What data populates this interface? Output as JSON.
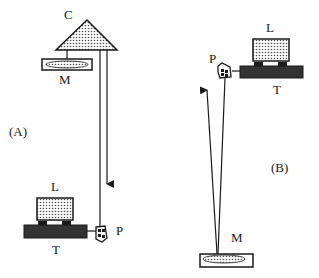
{
  "diagram": {
    "panel_a": {
      "label": "(A)",
      "components": {
        "C": "C",
        "M": "M",
        "L": "L",
        "T": "T",
        "P": "P"
      }
    },
    "panel_b": {
      "label": "(B)",
      "components": {
        "L": "L",
        "P": "P",
        "T": "T",
        "M": "M"
      }
    },
    "colors": {
      "stroke": "#1a1a1a",
      "dot_fill": "#b8b8b8",
      "table_fill": "#2a2a2a",
      "background": "#ffffff"
    }
  }
}
